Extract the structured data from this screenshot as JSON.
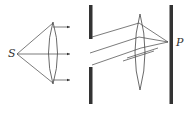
{
  "diagram": {
    "labels": {
      "source": "S",
      "point": "P"
    },
    "elements": [
      "point source S",
      "collimating convex lens",
      "parallel rays (arrows)",
      "slit barrier",
      "focusing convex lens",
      "observation screen",
      "point P on screen"
    ],
    "colors": {
      "stroke": "#333333",
      "barrier": "#333333",
      "background": "#ffffff"
    }
  }
}
